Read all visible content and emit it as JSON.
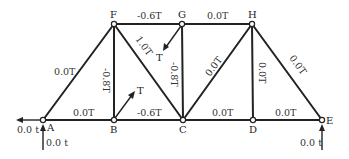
{
  "diagram": {
    "type": "truss",
    "nodes": [
      {
        "id": "A",
        "label": "A",
        "x": 43,
        "y": 120
      },
      {
        "id": "B",
        "label": "B",
        "x": 114,
        "y": 120
      },
      {
        "id": "C",
        "label": "C",
        "x": 183,
        "y": 120
      },
      {
        "id": "D",
        "label": "D",
        "x": 253,
        "y": 120
      },
      {
        "id": "E",
        "label": "E",
        "x": 322,
        "y": 120
      },
      {
        "id": "F",
        "label": "F",
        "x": 114,
        "y": 24
      },
      {
        "id": "G",
        "label": "G",
        "x": 182,
        "y": 24
      },
      {
        "id": "H",
        "label": "H",
        "x": 252,
        "y": 24
      }
    ],
    "members": [
      {
        "id": "AB",
        "from": "A",
        "to": "B",
        "force": "0.0T"
      },
      {
        "id": "BC",
        "from": "B",
        "to": "C",
        "force": "-0.6T"
      },
      {
        "id": "CD",
        "from": "C",
        "to": "D",
        "force": "0.0T"
      },
      {
        "id": "DE",
        "from": "D",
        "to": "E",
        "force": "0.0T"
      },
      {
        "id": "FG",
        "from": "F",
        "to": "G",
        "force": "-0.6T"
      },
      {
        "id": "GH",
        "from": "G",
        "to": "H",
        "force": "0.0T"
      },
      {
        "id": "AF",
        "from": "A",
        "to": "F",
        "force": "0.0T"
      },
      {
        "id": "BF",
        "from": "B",
        "to": "F",
        "force": "-0.8T"
      },
      {
        "id": "FC",
        "from": "F",
        "to": "C",
        "force": "1.0T"
      },
      {
        "id": "GC",
        "from": "G",
        "to": "C",
        "force": "-0.8T"
      },
      {
        "id": "CH",
        "from": "C",
        "to": "H",
        "force": "0.0T"
      },
      {
        "id": "HD",
        "from": "H",
        "to": "D",
        "force": "0.0T"
      },
      {
        "id": "HE",
        "from": "H",
        "to": "E",
        "force": "0.0T"
      }
    ],
    "loads": [
      {
        "id": "load-B",
        "at": "B",
        "label": "T",
        "direction": "up-right"
      },
      {
        "id": "load-G",
        "at": "G",
        "label": "T",
        "direction": "down-left"
      }
    ],
    "reactions": [
      {
        "id": "reaction-A-horizontal",
        "at": "A",
        "label": "0.0 t",
        "direction": "left"
      },
      {
        "id": "reaction-A-vertical",
        "at": "A",
        "label": "0.0 t",
        "direction": "up"
      },
      {
        "id": "reaction-E-vertical",
        "at": "E",
        "label": "0.0 t",
        "direction": "up"
      }
    ]
  },
  "labels": {
    "nodes": {
      "A": "A",
      "B": "B",
      "C": "C",
      "D": "D",
      "E": "E",
      "F": "F",
      "G": "G",
      "H": "H"
    },
    "forces": {
      "AB": "0.0T",
      "BC": "-0.6T",
      "CD": "0.0T",
      "DE": "0.0T",
      "FG": "-0.6T",
      "GH": "0.0T",
      "AF": "0.0T",
      "BF": "-0.8T",
      "FC": "1.0T",
      "GC": "-0.8T",
      "CH": "0.0T",
      "HD": "0.0T",
      "HE": "0.0T"
    },
    "loads": {
      "B": "T",
      "G": "T"
    },
    "reactions": {
      "A_h": "0.0 t",
      "A_v": "0.0 t",
      "E_v": "0.0 t"
    }
  }
}
